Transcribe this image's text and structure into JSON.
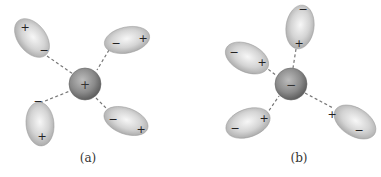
{
  "figure": {
    "panels": [
      {
        "label": "(a)",
        "ion": {
          "charge_sign": "+",
          "type": "cation"
        },
        "dipoles": [
          {
            "position": "top-left",
            "sign_end1": "+",
            "sign_end2": "−"
          },
          {
            "position": "top-right",
            "sign_end1": "−",
            "sign_end2": "+"
          },
          {
            "position": "bottom-left",
            "sign_end1": "−",
            "sign_end2": "+"
          },
          {
            "position": "bottom-right",
            "sign_end1": "−",
            "sign_end2": "+"
          }
        ]
      },
      {
        "label": "(b)",
        "ion": {
          "charge_sign": "−",
          "type": "anion"
        },
        "dipoles": [
          {
            "position": "top",
            "sign_end1": "−",
            "sign_end2": "+"
          },
          {
            "position": "left",
            "sign_end1": "−",
            "sign_end2": "+"
          },
          {
            "position": "bottom-left",
            "sign_end1": "−",
            "sign_end2": "+"
          },
          {
            "position": "bottom-right",
            "sign_end1": "+",
            "sign_end2": "−"
          }
        ]
      }
    ],
    "colors": {
      "dipole_fill_light": "#f4f4f4",
      "dipole_fill_dark": "#a9a9a9",
      "ion_fill_light": "#b5b5b5",
      "ion_fill_dark": "#606060",
      "dash": "#777777"
    }
  }
}
